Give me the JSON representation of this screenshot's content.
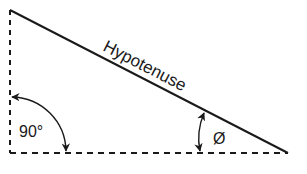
{
  "diagram": {
    "type": "right-triangle",
    "labels": {
      "hypotenuse": "Hypotenuse",
      "right_angle": "90°",
      "angle": "Ø"
    },
    "colors": {
      "stroke": "#1a1a1a",
      "background": "#ffffff"
    }
  }
}
